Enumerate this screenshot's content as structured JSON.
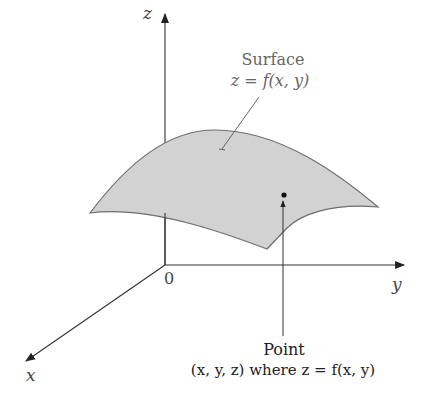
{
  "figure": {
    "type": "3d-surface-diagram",
    "axes": {
      "z_label": "z",
      "y_label": "y",
      "x_label": "x",
      "origin_label": "0"
    },
    "surface": {
      "title": "Surface",
      "equation": "z = f(x, y)",
      "fill_color": "#d4d4d4",
      "stroke_color": "#666666"
    },
    "point": {
      "title": "Point",
      "description": "(x, y, z) where z = f(x, y)"
    }
  }
}
